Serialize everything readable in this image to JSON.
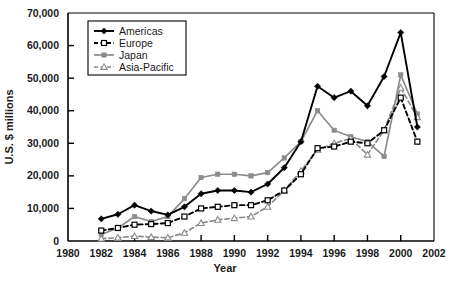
{
  "chart_data": {
    "type": "line",
    "title": "",
    "xlabel": "Year",
    "ylabel": "U.S. $ millions",
    "xlim": [
      1980,
      2002
    ],
    "ylim": [
      0,
      70000
    ],
    "grid": false,
    "legend_position": "top-left-inside",
    "x_ticks": [
      "1980",
      "1982",
      "1984",
      "1986",
      "1988",
      "1990",
      "1992",
      "1994",
      "1996",
      "1998",
      "2000",
      "2002"
    ],
    "x_tick_values": [
      1980,
      1982,
      1984,
      1986,
      1988,
      1990,
      1992,
      1994,
      1996,
      1998,
      2000,
      2002
    ],
    "y_ticks": [
      "0",
      "10,000",
      "20,000",
      "30,000",
      "40,000",
      "50,000",
      "60,000",
      "70,000"
    ],
    "y_tick_values": [
      0,
      10000,
      20000,
      30000,
      40000,
      50000,
      60000,
      70000
    ],
    "x": [
      1982,
      1983,
      1984,
      1985,
      1986,
      1987,
      1988,
      1989,
      1990,
      1991,
      1992,
      1993,
      1994,
      1995,
      1996,
      1997,
      1998,
      1999,
      2000,
      2001
    ],
    "series": [
      {
        "name": "Americas",
        "color": "#000000",
        "dash": "none",
        "marker": "filled-diamond",
        "values": [
          6800,
          8200,
          11000,
          9200,
          8000,
          10500,
          14500,
          15500,
          15500,
          15000,
          17500,
          22500,
          30500,
          47500,
          44000,
          46000,
          41500,
          50500,
          64000,
          35000
        ]
      },
      {
        "name": "Europe",
        "color": "#000000",
        "dash": "dashed",
        "marker": "open-square",
        "values": [
          3200,
          4000,
          5000,
          5200,
          5500,
          7500,
          10000,
          10500,
          11000,
          11000,
          12500,
          15500,
          20500,
          28500,
          29000,
          30500,
          30000,
          34000,
          44000,
          30500
        ]
      },
      {
        "name": "Japan",
        "color": "#8c8c8c",
        "dash": "none",
        "marker": "filled-square",
        "values": [
          2000,
          4000,
          7500,
          6000,
          7500,
          13000,
          19500,
          20500,
          20500,
          20000,
          21000,
          25500,
          30500,
          40000,
          34000,
          32000,
          30500,
          26000,
          51000,
          39000
        ]
      },
      {
        "name": "Asia-Pacific",
        "color": "#8c8c8c",
        "dash": "dashed",
        "marker": "open-triangle",
        "values": [
          700,
          1000,
          1500,
          1200,
          1000,
          2500,
          5500,
          6500,
          7000,
          7500,
          10500,
          15500,
          21500,
          28000,
          30000,
          31500,
          26500,
          34000,
          47000,
          38000
        ]
      }
    ]
  },
  "legend": {
    "entries": [
      "Americas",
      "Europe",
      "Japan",
      "Asia-Pacific"
    ]
  }
}
